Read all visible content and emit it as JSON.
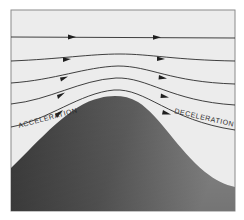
{
  "diagram": {
    "labels": {
      "left": "ACCELERATION",
      "right": "DECELERATION"
    },
    "colors": {
      "background": "#ebebeb",
      "frame": "#8a8a8a",
      "streamline": "#2b2b2b",
      "hill_dark": "#3c3c3c",
      "hill_light": "#8c8c8c"
    },
    "frame": {
      "x": 11,
      "y": 10,
      "width": 224,
      "height": 201
    },
    "streamlines": [
      {
        "id": 1,
        "left_y": 37,
        "peak_y": 37,
        "right_y": 38
      },
      {
        "id": 2,
        "left_y": 61,
        "peak_y": 55,
        "right_y": 61
      },
      {
        "id": 3,
        "left_y": 83,
        "peak_y": 68,
        "right_y": 84
      },
      {
        "id": 4,
        "left_y": 104,
        "peak_y": 80,
        "right_y": 105
      },
      {
        "id": 5,
        "left_y": 127,
        "peak_y": 92,
        "right_y": 130
      }
    ],
    "hill": {
      "left_y": 168,
      "peak_x": 118,
      "peak_y": 96,
      "right_y": 187
    },
    "flow_direction": "left-to-right"
  }
}
